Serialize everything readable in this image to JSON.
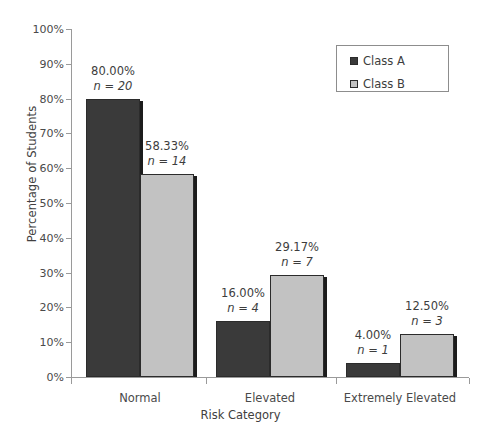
{
  "chart_data": {
    "type": "bar",
    "title": "",
    "xlabel": "Risk Category",
    "ylabel": "Percentage of Students",
    "categories": [
      "Normal",
      "Elevated",
      "Extremely Elevated"
    ],
    "ylim": [
      0,
      100
    ],
    "ytick_labels": [
      "0%",
      "10%",
      "20%",
      "30%",
      "40%",
      "50%",
      "60%",
      "70%",
      "80%",
      "90%",
      "100%"
    ],
    "ytick_values": [
      0,
      10,
      20,
      30,
      40,
      50,
      60,
      70,
      80,
      90,
      100
    ],
    "grid": false,
    "legend_position": "top-right",
    "series": [
      {
        "name": "Class A",
        "color": "#3a3a3a",
        "values": [
          80.0,
          16.0,
          4.0
        ],
        "counts": [
          20,
          4,
          1
        ],
        "pct_labels": [
          "80.00%",
          "16.00%",
          "4.00%"
        ],
        "n_labels": [
          "n = 20",
          "n = 4",
          "n = 1"
        ]
      },
      {
        "name": "Class B",
        "color": "#c2c2c2",
        "values": [
          58.33,
          29.17,
          12.5
        ],
        "counts": [
          14,
          7,
          3
        ],
        "pct_labels": [
          "58.33%",
          "29.17%",
          "12.50%"
        ],
        "n_labels": [
          "n = 14",
          "n = 7",
          "n = 3"
        ]
      }
    ]
  },
  "legend": {
    "items": [
      {
        "label": "Class A",
        "swatch": "dark"
      },
      {
        "label": "Class B",
        "swatch": "light"
      }
    ]
  },
  "axes": {
    "y_title": "Percentage of Students",
    "x_title": "Risk Category"
  }
}
